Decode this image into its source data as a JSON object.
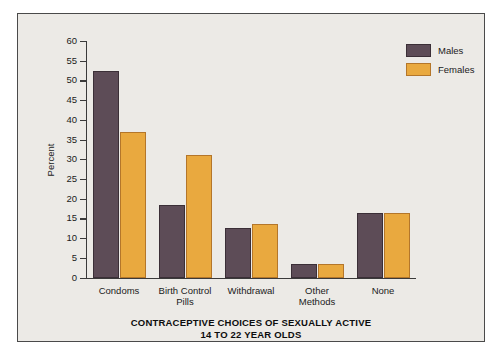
{
  "chart_data": {
    "type": "bar",
    "title": "CONTRACEPTIVE CHOICES OF SEXUALLY ACTIVE 14 TO 22 YEAR OLDS",
    "title_line1": "CONTRACEPTIVE CHOICES OF SEXUALLY ACTIVE",
    "title_line2": "14 TO 22 YEAR OLDS",
    "xlabel": "",
    "ylabel": "Percent",
    "ylim": [
      0,
      60
    ],
    "ytick_step": 5,
    "grid": false,
    "legend_position": "top-right",
    "categories": [
      "Condoms",
      "Birth Control Pills",
      "Withdrawal",
      "Other Methods",
      "None"
    ],
    "category_lines": [
      [
        "Condoms"
      ],
      [
        "Birth Control",
        "Pills"
      ],
      [
        "Withdrawal"
      ],
      [
        "Other",
        "Methods"
      ],
      [
        "None"
      ]
    ],
    "series": [
      {
        "name": "Males",
        "color": "#5D4C57",
        "values": [
          52.5,
          18.5,
          12.5,
          3.5,
          16.5
        ]
      },
      {
        "name": "Females",
        "color": "#E9A93F",
        "values": [
          37.0,
          31.0,
          13.5,
          3.5,
          16.5
        ]
      }
    ],
    "ytick_labels": [
      "0",
      "5",
      "10",
      "15",
      "20",
      "25",
      "30",
      "35",
      "40",
      "45",
      "50",
      "55",
      "60"
    ],
    "ytick_values": [
      0,
      5,
      10,
      15,
      20,
      25,
      30,
      35,
      40,
      45,
      50,
      55,
      60
    ]
  },
  "legend": {
    "items": [
      {
        "label": "Males",
        "color": "#5D4C57"
      },
      {
        "label": "Females",
        "color": "#E9A93F"
      }
    ]
  },
  "colors": {
    "males": "#5D4C57",
    "females": "#E9A93F",
    "panel_background": "#ECEAE6",
    "axis": "#3A3A3A",
    "text": "#1B1B1B"
  }
}
